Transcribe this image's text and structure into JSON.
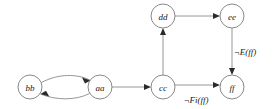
{
  "diagram": {
    "type": "directed-state-graph",
    "background_color": "#ffffff",
    "node_stroke_color": "#7a7a7a",
    "edge_stroke_color": "#8a8a8a",
    "label_color": "#1a1a1a",
    "nodes": [
      {
        "id": "bb",
        "label": "bb",
        "cx": 30,
        "cy": 87,
        "r": 12
      },
      {
        "id": "aa",
        "label": "aa",
        "cx": 100,
        "cy": 87,
        "r": 12
      },
      {
        "id": "cc",
        "label": "cc",
        "cx": 163,
        "cy": 87,
        "r": 12
      },
      {
        "id": "dd",
        "label": "dd",
        "cx": 163,
        "cy": 16,
        "r": 12
      },
      {
        "id": "ee",
        "label": "ee",
        "cx": 232,
        "cy": 16,
        "r": 12
      },
      {
        "id": "ff",
        "label": "ff",
        "cx": 232,
        "cy": 87,
        "r": 12
      }
    ],
    "edges": [
      {
        "id": "bb-to-aa",
        "from": "bb",
        "to": "aa",
        "style": "curved-upper",
        "label": ""
      },
      {
        "id": "aa-to-bb",
        "from": "aa",
        "to": "bb",
        "style": "curved-lower",
        "label": ""
      },
      {
        "id": "aa-to-cc",
        "from": "aa",
        "to": "cc",
        "style": "straight-horizontal",
        "label": ""
      },
      {
        "id": "cc-to-dd",
        "from": "cc",
        "to": "dd",
        "style": "straight-vertical",
        "label": ""
      },
      {
        "id": "dd-to-ee",
        "from": "dd",
        "to": "ee",
        "style": "straight-horizontal",
        "label": ""
      },
      {
        "id": "ee-to-ff",
        "from": "ee",
        "to": "ff",
        "style": "straight-vertical",
        "label": "¬E(ff)"
      },
      {
        "id": "cc-to-ff",
        "from": "cc",
        "to": "ff",
        "style": "straight-horizontal",
        "label": "¬Fi(ff)"
      }
    ],
    "edge_labels": {
      "not_e_ff": "¬E(ff)",
      "not_fi_ff": "¬Fi(ff)"
    }
  }
}
